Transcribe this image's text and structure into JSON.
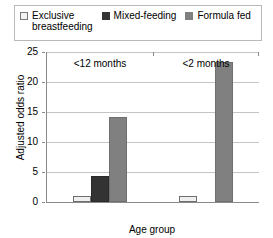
{
  "chart_data": {
    "type": "bar",
    "title": "",
    "xlabel": "Age group",
    "ylabel": "Adjusted odds ratio",
    "categories": [
      "<12 months",
      "<2 months"
    ],
    "series": [
      {
        "name": "Exclusive breastfeeding",
        "color": "#f2f2f2",
        "values": [
          1.0,
          1.0
        ]
      },
      {
        "name": "Mixed-feeding",
        "color": "#333333",
        "values": [
          4.3,
          null
        ]
      },
      {
        "name": "Formula fed",
        "color": "#808080",
        "values": [
          14.2,
          23.3
        ]
      }
    ],
    "ylim": [
      0,
      25
    ],
    "yticks": [
      0,
      5,
      10,
      15,
      20,
      25
    ],
    "ytick_labels": [
      "0",
      "5",
      "10",
      "15",
      "20",
      "25"
    ],
    "grid": true,
    "legend_position": "top"
  },
  "legend": {
    "entries": [
      {
        "label": "Exclusive\nbreastfeeding",
        "swatch": "exclusive-swatch"
      },
      {
        "label": "Mixed-feeding",
        "swatch": "mixed-swatch"
      },
      {
        "label": "Formula fed",
        "swatch": "formula-swatch"
      }
    ]
  },
  "axes": {
    "y_title": "Adjusted odds ratio",
    "x_title": "Age group",
    "y_ticks": [
      "25",
      "20",
      "15",
      "10",
      "5",
      "0"
    ],
    "x_ticks": [
      "<12 months",
      "<2 months"
    ]
  }
}
